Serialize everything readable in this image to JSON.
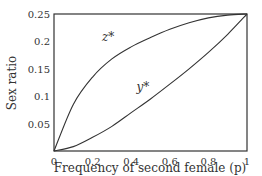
{
  "chart_data": {
    "type": "line",
    "title": "",
    "xlabel": "Frequency of second female (p)",
    "ylabel": "Sex ratio",
    "xlim": [
      0,
      1
    ],
    "ylim": [
      0,
      0.25
    ],
    "xticks": [
      "0",
      "0.2",
      "0.4",
      "0.6",
      "0.8",
      "1"
    ],
    "yticks": [
      "0.05",
      "0.1",
      "0.15",
      "0.2",
      "0.25"
    ],
    "grid": false,
    "legend": "inline labels",
    "series": [
      {
        "name": "z*",
        "x": [
          0,
          0.1,
          0.2,
          0.3,
          0.4,
          0.5,
          0.6,
          0.7,
          0.8,
          0.9,
          1.0
        ],
        "values": [
          0,
          0.085,
          0.135,
          0.168,
          0.19,
          0.207,
          0.222,
          0.234,
          0.243,
          0.248,
          0.25
        ]
      },
      {
        "name": "y*",
        "x": [
          0,
          0.1,
          0.2,
          0.3,
          0.4,
          0.5,
          0.6,
          0.7,
          0.8,
          0.9,
          1.0
        ],
        "values": [
          0,
          0.008,
          0.025,
          0.045,
          0.07,
          0.095,
          0.122,
          0.15,
          0.18,
          0.213,
          0.25
        ]
      }
    ],
    "annotations": [
      {
        "text": "z*",
        "x": 0.28,
        "y": 0.2
      },
      {
        "text": "y*",
        "x": 0.46,
        "y": 0.11
      }
    ]
  }
}
